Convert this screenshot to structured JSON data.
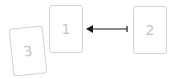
{
  "cards": [
    {
      "id": "card-1",
      "label": "1"
    },
    {
      "id": "card-2",
      "label": "2"
    },
    {
      "id": "card-3",
      "label": "3"
    }
  ],
  "arrow": {
    "from": "card-2",
    "to": "card-1",
    "color": "#1a1a1a"
  },
  "colors": {
    "card_border": "#d4d4d4",
    "card_text": "#c4c4c4",
    "background": "#ffffff"
  }
}
